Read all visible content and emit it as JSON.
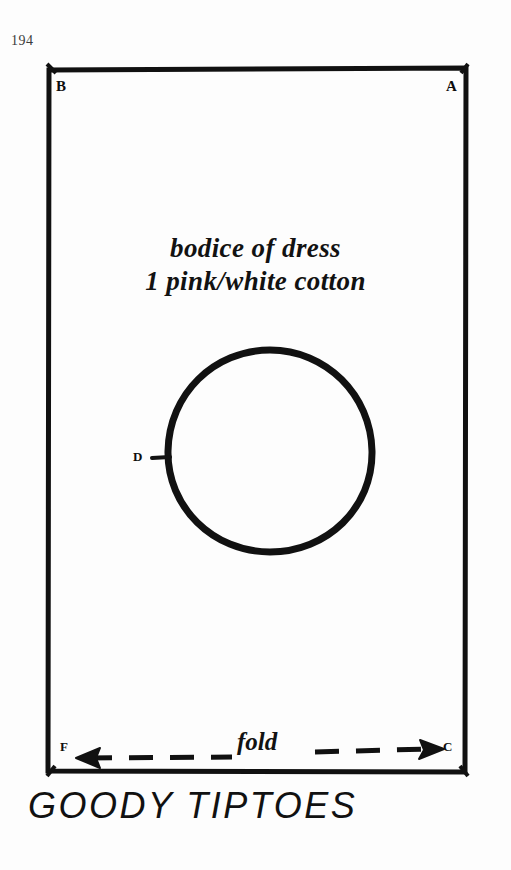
{
  "page": {
    "page_number": "194",
    "title": "GOODY TIPTOES",
    "background_color": "#fdfdfd",
    "ink_color": "#111111"
  },
  "pattern": {
    "name": "bodice-pattern-piece",
    "caption_line_1": "bodice of dress",
    "caption_line_2": "1 pink/white cotton",
    "rectangle": {
      "x": 48,
      "y": 68,
      "width": 418,
      "height": 704,
      "stroke_width": 5
    },
    "corner_labels": [
      {
        "id": "A",
        "text": "A",
        "position": "top-right"
      },
      {
        "id": "B",
        "text": "B",
        "position": "top-left"
      },
      {
        "id": "C",
        "text": "C",
        "position": "bottom-right"
      },
      {
        "id": "F",
        "text": "F",
        "position": "bottom-left"
      }
    ],
    "circle": {
      "label": "D",
      "center_x": 270,
      "center_y": 451,
      "radius": 101,
      "stroke_width": 7
    },
    "fold_line": {
      "label": "fold",
      "style": "dashed double-headed arrow",
      "y": 758,
      "x_start": 76,
      "x_end": 442
    }
  }
}
